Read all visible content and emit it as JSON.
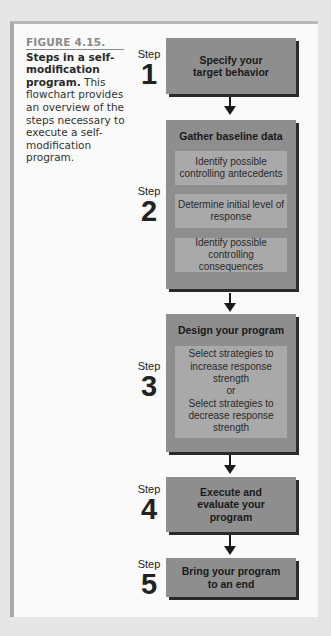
{
  "caption": {
    "figure_label": "FIGURE 4.15.",
    "title": "Steps in a self-modification program.",
    "body": "This flowchart provides an overview of the steps necessary to execute a self-modification program."
  },
  "steps": [
    {
      "word": "Step",
      "number": "1",
      "title": "Specify your target behavior",
      "substeps": []
    },
    {
      "word": "Step",
      "number": "2",
      "title": "Gather baseline data",
      "substeps": [
        "Identify possible controlling antecedents",
        "Determine initial level of response",
        "Identify possible controlling consequences"
      ]
    },
    {
      "word": "Step",
      "number": "3",
      "title": "Design your program",
      "substeps": [
        "Select strategies to increase response strength\nor\nSelect strategies to decrease response strength"
      ]
    },
    {
      "word": "Step",
      "number": "4",
      "title": "Execute and evaluate your program",
      "substeps": []
    },
    {
      "word": "Step",
      "number": "5",
      "title": "Bring your program to an end",
      "substeps": []
    }
  ],
  "colors": {
    "box": "#8e8e8e",
    "inner_box": "#a9a9a9",
    "shadow": "#2a2a2a",
    "page": "#fafafa",
    "background": "#e6e6e6"
  }
}
